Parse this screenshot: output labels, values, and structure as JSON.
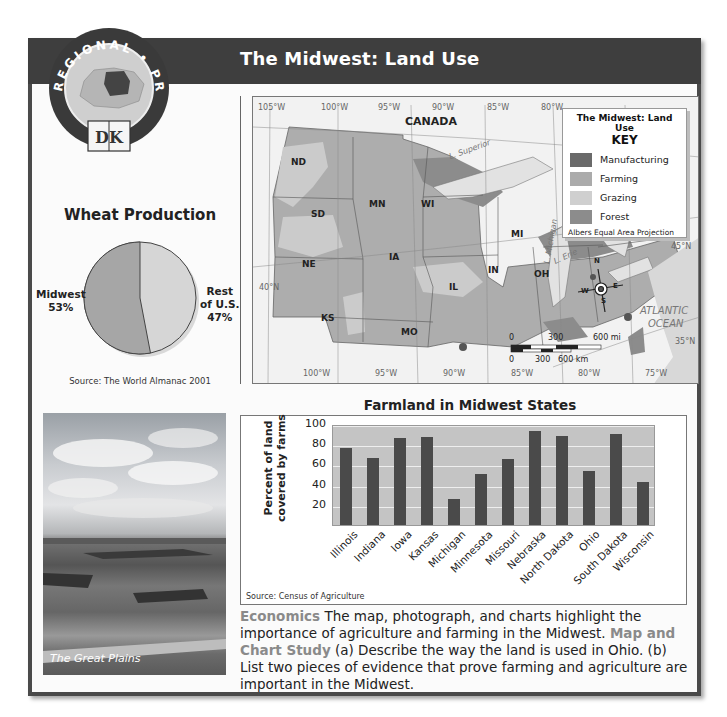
{
  "header": {
    "title": "The Midwest: Land Use",
    "badge": {
      "top_text": "REGIONAL • PROFILE",
      "logo": "DK"
    }
  },
  "pie": {
    "title": "Wheat Production",
    "source": "Source:  The World Almanac 2001",
    "slices": [
      {
        "label_line1": "Midwest",
        "label_line2": "53%",
        "color": "#a6a6a6"
      },
      {
        "label_line1": "Rest",
        "label_line2": "of U.S.",
        "label_line3": "47%",
        "color": "#d6d6d6"
      }
    ]
  },
  "map": {
    "key": {
      "title": "The Midwest: Land Use",
      "subtitle": "KEY",
      "items": [
        {
          "label": "Manufacturing",
          "color": "#6a6a6a"
        },
        {
          "label": "Farming",
          "color": "#ababab"
        },
        {
          "label": "Grazing",
          "color": "#cfcfcf"
        },
        {
          "label": "Forest",
          "color": "#8c8c8c"
        }
      ],
      "projection": "Albers Equal Area Projection"
    },
    "country_label": "CANADA",
    "states": [
      "ND",
      "SD",
      "NE",
      "KS",
      "MN",
      "IA",
      "MO",
      "WI",
      "IL",
      "IN",
      "MI",
      "OH"
    ],
    "lakes": [
      "L. Superior",
      "L. Michigan",
      "L. Huron",
      "L. Erie"
    ],
    "ocean": [
      "ATLANTIC",
      "OCEAN"
    ],
    "longitudes_top": [
      "105°W",
      "100°W",
      "95°W",
      "90°W",
      "85°W",
      "80°W"
    ],
    "longitudes_bottom": [
      "100°W",
      "95°W",
      "90°W",
      "85°W",
      "80°W",
      "75°W"
    ],
    "latitudes": [
      "45°N",
      "40°N",
      "35°N"
    ],
    "scale": {
      "mi": [
        "0",
        "300",
        "600 mi"
      ],
      "km": [
        "0",
        "300",
        "600 km"
      ]
    },
    "compass": [
      "N",
      "E",
      "S",
      "W"
    ]
  },
  "photo": {
    "caption": "The Great Plains"
  },
  "chart_data": [
    {
      "type": "pie",
      "title": "Wheat Production",
      "categories": [
        "Midwest",
        "Rest of U.S."
      ],
      "values": [
        53,
        47
      ],
      "source": "The World Almanac 2001"
    },
    {
      "type": "bar",
      "title": "Farmland in Midwest States",
      "ylabel": "Percent of land covered by farms",
      "xlabel": "",
      "categories": [
        "Illinois",
        "Indiana",
        "Iowa",
        "Kansas",
        "Michigan",
        "Minnesota",
        "Missouri",
        "Nebraska",
        "North Dakota",
        "Ohio",
        "South Dakota",
        "Wisconsin"
      ],
      "values": [
        76,
        66,
        86,
        87,
        26,
        51,
        65,
        93,
        88,
        53,
        90,
        43
      ],
      "yticks": [
        20,
        40,
        60,
        80,
        100
      ],
      "ylim": [
        0,
        100
      ],
      "grid": true,
      "source": "Source:  Census of Agriculture"
    }
  ],
  "caption": {
    "lead": "Economics",
    "text1": " The map, photograph, and charts highlight the importance of agriculture and farming in the Midwest. ",
    "study": "Map and Chart Study",
    "text2": "  (a) Describe the way the land is used in Ohio. (b) List two pieces of evidence that prove farming and agriculture are important in the Midwest."
  }
}
